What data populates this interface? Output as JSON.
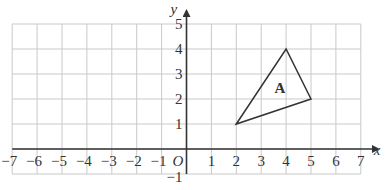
{
  "diagram": {
    "type": "coordinate-grid",
    "axes": {
      "x_label": "x",
      "y_label": "y",
      "origin_label": "O",
      "x_range": [
        -7,
        7
      ],
      "y_range": [
        -1,
        5
      ],
      "x_ticks": [
        {
          "value": -7,
          "label": "−7"
        },
        {
          "value": -6,
          "label": "−6"
        },
        {
          "value": -5,
          "label": "−5"
        },
        {
          "value": -4,
          "label": "−4"
        },
        {
          "value": -3,
          "label": "−3"
        },
        {
          "value": -2,
          "label": "−2"
        },
        {
          "value": -1,
          "label": "−1"
        },
        {
          "value": 1,
          "label": "1"
        },
        {
          "value": 2,
          "label": "2"
        },
        {
          "value": 3,
          "label": "3"
        },
        {
          "value": 4,
          "label": "4"
        },
        {
          "value": 5,
          "label": "5"
        },
        {
          "value": 6,
          "label": "6"
        },
        {
          "value": 7,
          "label": "7"
        }
      ],
      "y_ticks": [
        {
          "value": 5,
          "label": "5"
        },
        {
          "value": 4,
          "label": "4"
        },
        {
          "value": 3,
          "label": "3"
        },
        {
          "value": 2,
          "label": "2"
        },
        {
          "value": 1,
          "label": "1"
        },
        {
          "value": -1,
          "label": "−1"
        }
      ]
    },
    "shapes": [
      {
        "name": "triangle-A",
        "label": "A",
        "vertices": [
          [
            2,
            1
          ],
          [
            4,
            4
          ],
          [
            5,
            2
          ]
        ],
        "label_position": [
          3.75,
          2.45
        ]
      }
    ],
    "colors": {
      "grid": "#c9c9c9",
      "axis": "#333333",
      "shape": "#333333",
      "text": "#333333"
    }
  }
}
